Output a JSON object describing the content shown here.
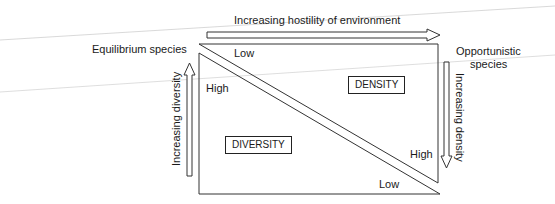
{
  "diagram": {
    "top_axis_label": "Increasing hostility of environment",
    "left_species": "Equilibrium species",
    "right_species_line1": "Opportunistic",
    "right_species_line2": "species",
    "left_axis_label": "Increasing diversity",
    "right_axis_label": "Increasing density",
    "upper_triangle": {
      "box_label": "DENSITY",
      "low_label": "Low",
      "high_label": "High"
    },
    "lower_triangle": {
      "box_label": "DIVERSITY",
      "high_label": "High",
      "low_label": "Low"
    },
    "colors": {
      "line": "#333333",
      "scan_line": "#c8c8c8"
    }
  }
}
